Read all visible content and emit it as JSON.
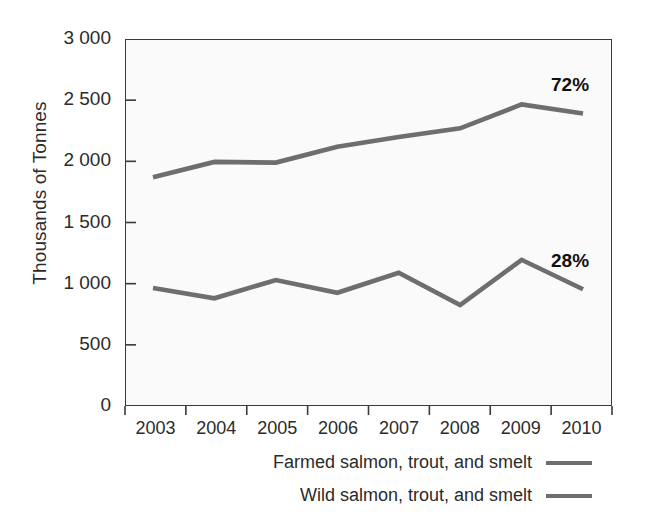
{
  "chart_data": {
    "type": "line",
    "title": "",
    "subtitle": "",
    "xlabel": "",
    "ylabel": "Thousands of Tonnes",
    "categories": [
      "2003",
      "2004",
      "2005",
      "2006",
      "2007",
      "2008",
      "2009",
      "2010"
    ],
    "x": [
      2003,
      2004,
      2005,
      2006,
      2007,
      2008,
      2009,
      2010
    ],
    "xlim": [
      2003,
      2010
    ],
    "ylim": [
      0,
      3000
    ],
    "ytick_labels": [
      "3 000",
      "2 500",
      "2 000",
      "1 500",
      "1 000",
      "500",
      "0"
    ],
    "ytick_values": [
      3000,
      2500,
      2000,
      1500,
      1000,
      500,
      0
    ],
    "grid": false,
    "legend_position": "below-right",
    "series": [
      {
        "name": "Farmed salmon, trout, and smelt",
        "color": "#6e6e6e",
        "values": [
          1870,
          1995,
          1990,
          2120,
          2200,
          2270,
          2465,
          2390
        ]
      },
      {
        "name": "Wild salmon, trout, and smelt",
        "color": "#6e6e6e",
        "values": [
          965,
          880,
          1030,
          925,
          1090,
          825,
          1195,
          955
        ]
      }
    ],
    "annotations": [
      {
        "text": "72%",
        "series": "Farmed salmon, trout, and smelt",
        "x": 2010,
        "y": 2620
      },
      {
        "text": "28%",
        "series": "Wild salmon, trout, and smelt",
        "x": 2010,
        "y": 1185
      }
    ]
  },
  "axis": {
    "y_title": "Thousands of Tonnes"
  },
  "legend": {
    "items": [
      {
        "label": "Farmed salmon, trout, and smelt"
      },
      {
        "label": "Wild salmon, trout, and smelt"
      }
    ]
  }
}
